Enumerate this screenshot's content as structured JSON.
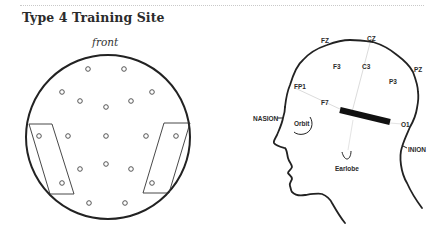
{
  "title": "Type 4 Training Site",
  "top_view": {
    "orientation_label": "front",
    "circle": {
      "cx": 108,
      "cy": 137,
      "r": 82
    },
    "electrodes": [
      {
        "x": 88,
        "y": 69
      },
      {
        "x": 124,
        "y": 69
      },
      {
        "x": 62,
        "y": 92
      },
      {
        "x": 152,
        "y": 92
      },
      {
        "x": 80,
        "y": 101
      },
      {
        "x": 131,
        "y": 101
      },
      {
        "x": 106,
        "y": 107
      },
      {
        "x": 39,
        "y": 136
      },
      {
        "x": 68,
        "y": 136
      },
      {
        "x": 106,
        "y": 136
      },
      {
        "x": 146,
        "y": 136
      },
      {
        "x": 176,
        "y": 136
      },
      {
        "x": 106,
        "y": 164
      },
      {
        "x": 80,
        "y": 169
      },
      {
        "x": 131,
        "y": 169
      },
      {
        "x": 62,
        "y": 183
      },
      {
        "x": 152,
        "y": 183
      },
      {
        "x": 89,
        "y": 203
      },
      {
        "x": 125,
        "y": 203
      }
    ],
    "pads": [
      {
        "name": "left-pad",
        "points": "29,124 52,124 74,194 50,194"
      },
      {
        "name": "right-pad",
        "points": "164,123 190,123 169,193 143,193"
      }
    ]
  },
  "side_view": {
    "labels": {
      "fz": "FZ",
      "cz": "CZ",
      "f3": "F3",
      "c3": "C3",
      "pz": "PZ",
      "p3": "P3",
      "fp1": "FP1",
      "f7": "F7",
      "o1": "O1",
      "nasion": "NASION",
      "inion": "INION",
      "orbit": "Orbit",
      "earlobe": "Earlobe"
    },
    "colors": {
      "outline": "#222222",
      "guide_lines": "#dcdcdc",
      "electrode_bar": "#111111"
    }
  }
}
